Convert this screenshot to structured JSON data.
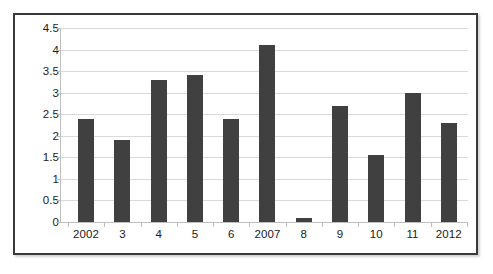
{
  "chart_data": {
    "type": "bar",
    "title": "",
    "subtitle": "",
    "xlabel": "",
    "ylabel": "",
    "categories": [
      "2002",
      "3",
      "4",
      "5",
      "6",
      "2007",
      "8",
      "9",
      "10",
      "11",
      "2012"
    ],
    "values": [
      2.4,
      1.9,
      3.3,
      3.4,
      2.4,
      4.1,
      0.1,
      2.7,
      1.55,
      3.0,
      2.3
    ],
    "ylim": [
      0,
      4.5
    ],
    "y_ticks": [
      0,
      0.5,
      1,
      1.5,
      2,
      2.5,
      3,
      3.5,
      4,
      4.5
    ],
    "y_tick_labels": [
      "0",
      "0.5",
      "1",
      "1.5",
      "2",
      "2.5",
      "3",
      "3.5",
      "4",
      "4.5"
    ],
    "grid": true,
    "legend": false,
    "legend_position": "none",
    "series": [
      {
        "name": "",
        "values": [
          2.4,
          1.9,
          3.3,
          3.4,
          2.4,
          4.1,
          0.1,
          2.7,
          1.55,
          3.0,
          2.3
        ]
      }
    ]
  },
  "style": {
    "bar_color": "#404040",
    "gridline_color": "#d9d9d9",
    "axis_color": "#bfbfbf",
    "frame_color": "#3a3a3a",
    "background": "#ffffff",
    "text_color": "#1a1a1a"
  }
}
